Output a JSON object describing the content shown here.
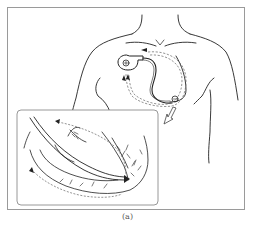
{
  "figure": {
    "caption": "(a)",
    "panels": [
      {
        "name": "chest-view",
        "elements": [
          "torso-outline",
          "pacemaker-device",
          "lead-wire",
          "electrode-tip",
          "dashed-signal-paths",
          "flow-arrows"
        ]
      },
      {
        "name": "heart-inset",
        "elements": [
          "heart-wall",
          "lead-in-ventricle",
          "lead-tip-arrow",
          "purkinje-fibers",
          "dashed-conduction-paths"
        ]
      }
    ],
    "device_symbol": "⊕",
    "electrode_symbol": "⊖"
  },
  "colors": {
    "line": "#222222",
    "dashed": "#666666",
    "frame": "#9a9a9a",
    "inset_frame": "#8c8c8c"
  }
}
